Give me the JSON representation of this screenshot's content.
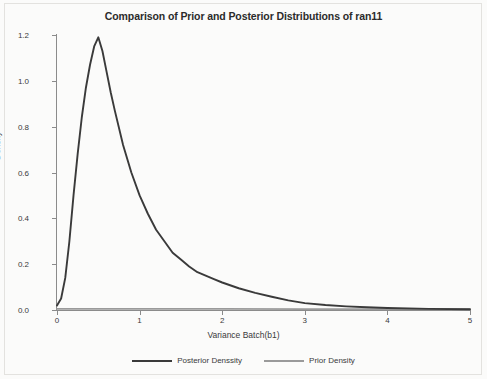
{
  "chart_data": {
    "type": "line",
    "title": "Comparison of Prior and Posterior Distributions of ran11",
    "xlabel": "Variance Batch(b1)",
    "ylabel": "Density",
    "xlim": [
      0,
      5
    ],
    "ylim": [
      0.0,
      1.2
    ],
    "xticks": [
      "0",
      "1",
      "2",
      "3",
      "4",
      "5"
    ],
    "xtick_values": [
      0,
      1,
      2,
      3,
      4,
      5
    ],
    "yticks": [
      "0.0",
      "0.2",
      "0.4",
      "0.6",
      "0.8",
      "1.0",
      "1.2"
    ],
    "ytick_values": [
      0.0,
      0.2,
      0.4,
      0.6,
      0.8,
      1.0,
      1.2
    ],
    "grid": false,
    "legend_position": "bottom",
    "series": [
      {
        "name": "Posterior Denssity",
        "color": "#3a3a3a",
        "x": [
          0.0,
          0.05,
          0.1,
          0.15,
          0.2,
          0.25,
          0.3,
          0.35,
          0.4,
          0.45,
          0.5,
          0.55,
          0.6,
          0.65,
          0.7,
          0.8,
          0.9,
          1.0,
          1.1,
          1.2,
          1.3,
          1.4,
          1.5,
          1.6,
          1.7,
          1.8,
          1.9,
          2.0,
          2.2,
          2.4,
          2.6,
          2.8,
          3.0,
          3.25,
          3.5,
          3.75,
          4.0,
          4.5,
          5.0
        ],
        "y": [
          0.02,
          0.05,
          0.14,
          0.3,
          0.5,
          0.68,
          0.84,
          0.97,
          1.07,
          1.15,
          1.19,
          1.13,
          1.04,
          0.95,
          0.87,
          0.72,
          0.6,
          0.5,
          0.42,
          0.35,
          0.3,
          0.25,
          0.22,
          0.19,
          0.165,
          0.15,
          0.135,
          0.12,
          0.095,
          0.075,
          0.058,
          0.042,
          0.03,
          0.022,
          0.016,
          0.012,
          0.009,
          0.005,
          0.003
        ]
      },
      {
        "name": "Prior Density",
        "color": "#9a9a9a",
        "x": [
          0.0,
          1.0,
          2.0,
          3.0,
          4.0,
          5.0
        ],
        "y": [
          0.005,
          0.005,
          0.005,
          0.004,
          0.004,
          0.003
        ]
      }
    ]
  },
  "legend": {
    "posterior_label": "Posterior Denssity",
    "prior_label": "Prior Density"
  }
}
